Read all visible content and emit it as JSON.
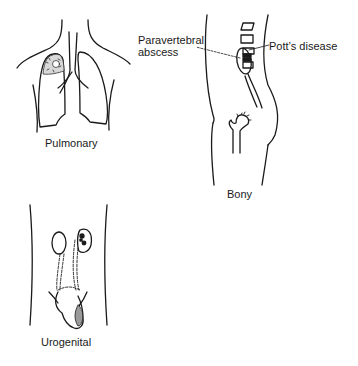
{
  "figure": {
    "panels": [
      {
        "id": "pulmonary",
        "caption": "Pulmonary"
      },
      {
        "id": "bony",
        "caption": "Bony",
        "annotations": [
          "Paravertebral abscess",
          "Pott's disease"
        ]
      },
      {
        "id": "urogenital",
        "caption": "Urogenital"
      }
    ]
  },
  "labels": {
    "pulmonary": "Pulmonary",
    "bony": "Bony",
    "urogenital": "Urogenital",
    "paravertebral_line1": "Paravertebral",
    "paravertebral_line2": "abscess",
    "potts": "Pott’s disease"
  },
  "colors": {
    "ink": "#1a1a1a",
    "background": "#ffffff"
  }
}
